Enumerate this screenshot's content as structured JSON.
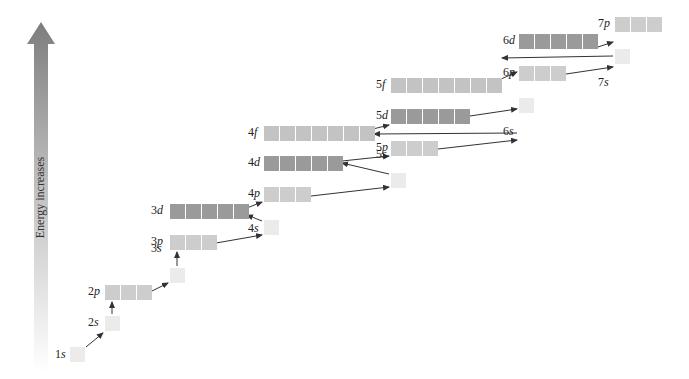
{
  "diagram": {
    "axis_label": "Energy increases",
    "colors": {
      "s": "#ebebeb",
      "p": "#cdcdcd",
      "d": "#9a9a9a",
      "f": "#c3c3c3",
      "arrow": "#333333",
      "energy_top": "#808080",
      "energy_bottom": "#ffffff"
    },
    "orbitals": [
      {
        "id": "1s",
        "n": "1",
        "l": "s",
        "boxes": 1,
        "x": 70,
        "y": 347,
        "lx": 55,
        "ly": 350
      },
      {
        "id": "2s",
        "n": "2",
        "l": "s",
        "boxes": 1,
        "x": 105,
        "y": 316,
        "lx": 88,
        "ly": 318
      },
      {
        "id": "2p",
        "n": "2",
        "l": "p",
        "boxes": 3,
        "x": 105,
        "y": 285,
        "lx": 88,
        "ly": 287
      },
      {
        "id": "3s",
        "n": "3",
        "l": "s",
        "boxes": 1,
        "x": 170,
        "y": 268,
        "lx": 151,
        "ly": 244
      },
      {
        "id": "3p",
        "n": "3",
        "l": "p",
        "boxes": 3,
        "x": 170,
        "y": 235,
        "lx": 151,
        "ly": 237
      },
      {
        "id": "3d",
        "n": "3",
        "l": "d",
        "boxes": 5,
        "x": 170,
        "y": 204,
        "lx": 151,
        "ly": 206
      },
      {
        "id": "4s",
        "n": "4",
        "l": "s",
        "boxes": 1,
        "x": 264,
        "y": 220,
        "lx": 248,
        "ly": 224
      },
      {
        "id": "4p",
        "n": "4",
        "l": "p",
        "boxes": 3,
        "x": 264,
        "y": 187,
        "lx": 248,
        "ly": 189
      },
      {
        "id": "4d",
        "n": "4",
        "l": "d",
        "boxes": 5,
        "x": 264,
        "y": 156,
        "lx": 248,
        "ly": 158
      },
      {
        "id": "4f",
        "n": "4",
        "l": "f",
        "boxes": 7,
        "x": 264,
        "y": 126,
        "lx": 248,
        "ly": 128
      },
      {
        "id": "5s",
        "n": "5",
        "l": "s",
        "boxes": 1,
        "x": 391,
        "y": 173,
        "lx": 376,
        "ly": 150
      },
      {
        "id": "5p",
        "n": "5",
        "l": "p",
        "boxes": 3,
        "x": 391,
        "y": 141,
        "lx": 376,
        "ly": 143
      },
      {
        "id": "5d",
        "n": "5",
        "l": "d",
        "boxes": 5,
        "x": 391,
        "y": 109,
        "lx": 376,
        "ly": 111
      },
      {
        "id": "5f",
        "n": "5",
        "l": "f",
        "boxes": 7,
        "x": 391,
        "y": 78,
        "lx": 376,
        "ly": 80
      },
      {
        "id": "6s",
        "n": "6",
        "l": "s",
        "boxes": 1,
        "x": 519,
        "y": 98,
        "lx": 503,
        "ly": 127
      },
      {
        "id": "6p",
        "n": "6",
        "l": "p",
        "boxes": 3,
        "x": 519,
        "y": 66,
        "lx": 503,
        "ly": 68
      },
      {
        "id": "6d",
        "n": "6",
        "l": "d",
        "boxes": 5,
        "x": 519,
        "y": 34,
        "lx": 503,
        "ly": 36
      },
      {
        "id": "7s",
        "n": "7",
        "l": "s",
        "boxes": 1,
        "x": 615,
        "y": 49,
        "lx": 598,
        "ly": 78
      },
      {
        "id": "7p",
        "n": "7",
        "l": "p",
        "boxes": 3,
        "x": 615,
        "y": 17,
        "lx": 598,
        "ly": 19
      }
    ],
    "arrows": [
      {
        "from": "1s",
        "to": "2s",
        "x1": 86,
        "y1": 347,
        "x2": 103,
        "y2": 333
      },
      {
        "from": "2s",
        "to": "2p",
        "x1": 112,
        "y1": 314,
        "x2": 112,
        "y2": 302
      },
      {
        "from": "2p",
        "to": "3s",
        "x1": 152,
        "y1": 291,
        "x2": 168,
        "y2": 283
      },
      {
        "from": "3s",
        "to": "3p",
        "x1": 177,
        "y1": 266,
        "x2": 177,
        "y2": 252
      },
      {
        "from": "3p",
        "to": "4s",
        "x1": 216,
        "y1": 243,
        "x2": 262,
        "y2": 235
      },
      {
        "from": "4s",
        "to": "3d",
        "x1": 262,
        "y1": 221,
        "x2": 247,
        "y2": 215
      },
      {
        "from": "3d",
        "to": "4p",
        "x1": 247,
        "y1": 208,
        "x2": 262,
        "y2": 202
      },
      {
        "from": "4p",
        "to": "5s",
        "x1": 311,
        "y1": 196,
        "x2": 389,
        "y2": 187
      },
      {
        "from": "5s",
        "to": "4d",
        "x1": 389,
        "y1": 174,
        "x2": 342,
        "y2": 163
      },
      {
        "from": "4d",
        "to": "5p",
        "x1": 342,
        "y1": 161,
        "x2": 389,
        "y2": 156
      },
      {
        "from": "5p",
        "to": "6s",
        "x1": 438,
        "y1": 149,
        "x2": 517,
        "y2": 140
      },
      {
        "from": "6s",
        "to": "4f",
        "x1": 517,
        "y1": 133,
        "x2": 374,
        "y2": 134
      },
      {
        "from": "4f",
        "to": "5d",
        "x1": 373,
        "y1": 129,
        "x2": 389,
        "y2": 125
      },
      {
        "from": "5d",
        "to": "6p",
        "x1": 470,
        "y1": 116,
        "x2": 517,
        "y2": 109
      },
      {
        "from": "6p",
        "to": "7s",
        "x1": 566,
        "y1": 74,
        "x2": 613,
        "y2": 67
      },
      {
        "from": "7s",
        "to": "5f",
        "x1": 613,
        "y1": 56,
        "x2": 502,
        "y2": 58
      },
      {
        "from": "5f",
        "to": "6d",
        "x1": 501,
        "y1": 79,
        "x2": 517,
        "y2": 72
      },
      {
        "from": "6d",
        "to": "7p",
        "x1": 598,
        "y1": 47,
        "x2": 613,
        "y2": 42
      }
    ]
  }
}
